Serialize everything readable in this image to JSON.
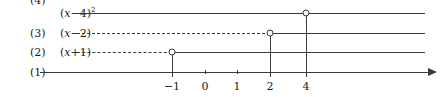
{
  "figure": {
    "type": "number-line-diagram",
    "width": 443,
    "height": 97,
    "background": "#ffffff",
    "ink_color": "#3a3a3a",
    "text_color": "#1a1a1a"
  },
  "axis": {
    "name": "real-number-line",
    "y": 72,
    "x_start": 40,
    "x_end": 428,
    "arrow_tip_x": 437,
    "unit_px": 33,
    "origin_x": 205,
    "style": "solid",
    "ticks": [
      {
        "value": -1,
        "label": "−1",
        "x": 172,
        "size": "major"
      },
      {
        "value": 0,
        "label": "0",
        "x": 205,
        "size": "minor"
      },
      {
        "value": 1,
        "label": "1",
        "x": 237,
        "size": "minor"
      },
      {
        "value": 2,
        "label": "2",
        "x": 270,
        "size": "major"
      },
      {
        "value": 4,
        "label": "4",
        "x": 306,
        "size": "major"
      }
    ]
  },
  "rows": [
    {
      "id": "row-4",
      "index_label": "(4)",
      "expression_parts": {
        "open": "(",
        "var": "x",
        "op": "−",
        "num": "4",
        "close": ")",
        "exponent": "2"
      },
      "expression_text": "(x−4)²",
      "y": 13,
      "line_start_x": 72,
      "line_end_x": 425,
      "left_style": "solid",
      "right_style": "solid",
      "marker": {
        "type": "open-circle",
        "x": 306,
        "value": 4,
        "drop_to_y": 72
      }
    },
    {
      "id": "row-3",
      "index_label": "(3)",
      "expression_parts": {
        "open": "(",
        "var": "x",
        "op": "−",
        "num": "2",
        "close": ")",
        "exponent": ""
      },
      "expression_text": "(x−2)",
      "y": 33,
      "line_start_x": 72,
      "line_end_x": 425,
      "left_style": "dashed",
      "right_style": "solid",
      "marker": {
        "type": "open-circle",
        "x": 270,
        "value": 2,
        "drop_to_y": 72
      }
    },
    {
      "id": "row-2",
      "index_label": "(2)",
      "expression_parts": {
        "open": "(",
        "var": "x",
        "op": "+",
        "num": "1",
        "close": ")",
        "exponent": ""
      },
      "expression_text": "(x+1)",
      "y": 52,
      "line_start_x": 72,
      "line_end_x": 425,
      "left_style": "dashed",
      "right_style": "solid",
      "marker": {
        "type": "open-circle",
        "x": 172,
        "value": -1,
        "drop_to_y": 72
      }
    },
    {
      "id": "row-1",
      "index_label": "(1)",
      "expression_parts": {
        "open": "",
        "var": "",
        "op": "",
        "num": "",
        "close": "",
        "exponent": ""
      },
      "expression_text": "",
      "y": 72,
      "line_start_x": 40,
      "line_end_x": 428,
      "left_style": "solid",
      "right_style": "solid",
      "marker": null
    }
  ]
}
